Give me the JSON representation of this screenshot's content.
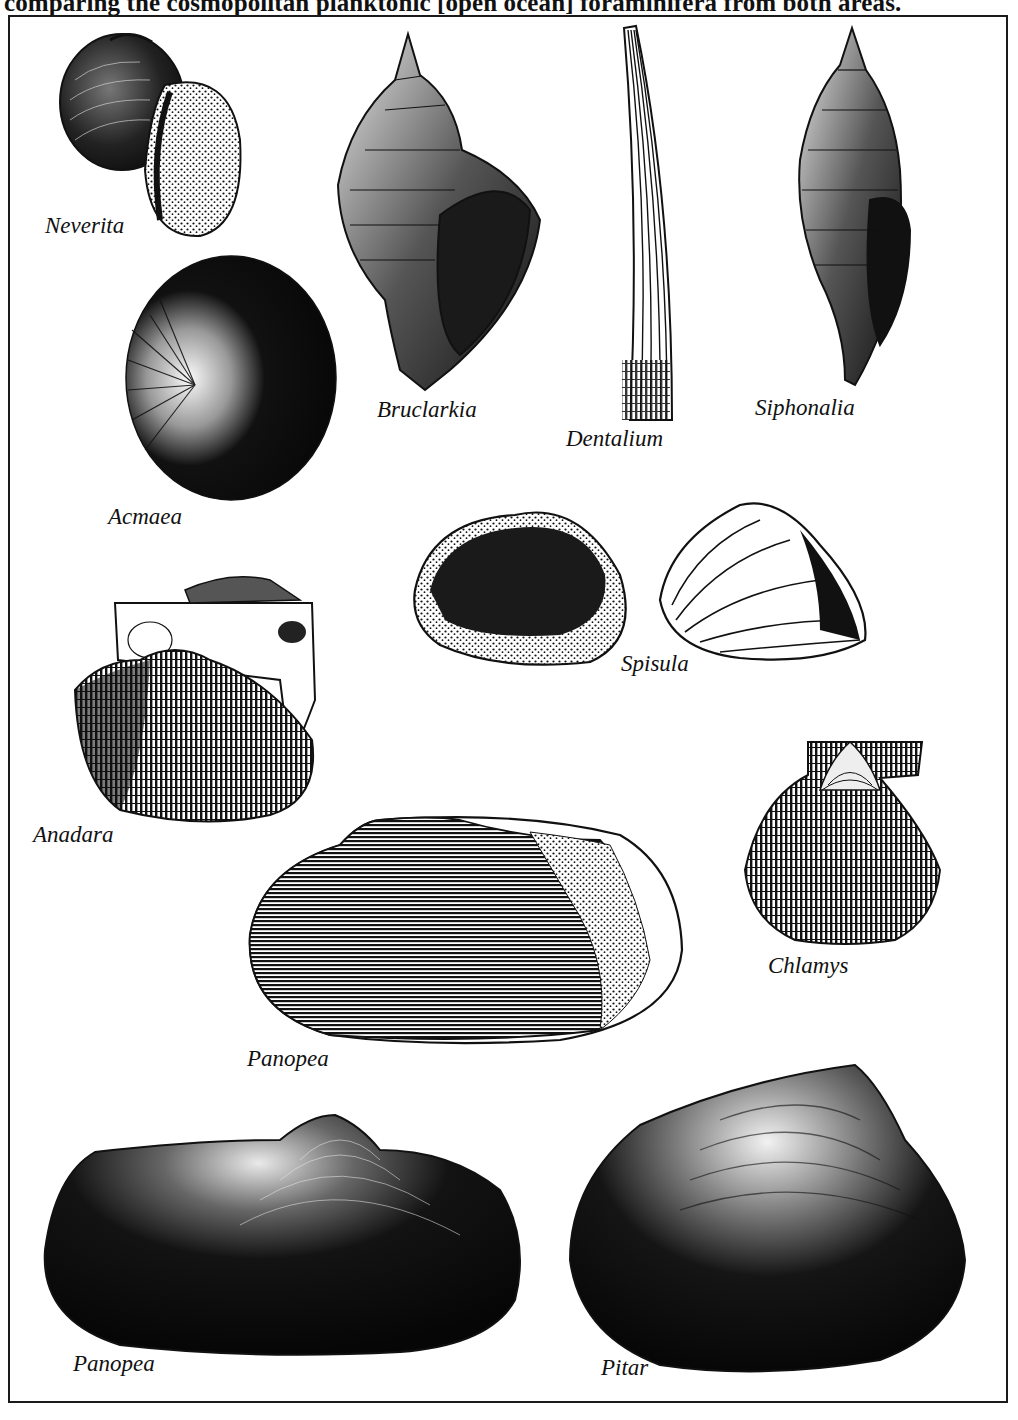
{
  "caption": "comparing the cosmopolitan planktonic [open ocean] foraminifera from both areas.",
  "figure": {
    "type": "shell-illustration-plate",
    "style": "black-and-white engraving",
    "colors": {
      "ink": "#111111",
      "paper": "#ffffff",
      "frame": "#1a1a1a"
    },
    "specimens": [
      {
        "id": "neverita",
        "label": "Neverita",
        "kind": "gastropod (moon snail)"
      },
      {
        "id": "bruclarkia",
        "label": "Bruclarkia",
        "kind": "gastropod (whelk)"
      },
      {
        "id": "dentalium",
        "label": "Dentalium",
        "kind": "scaphopod (tusk shell)"
      },
      {
        "id": "siphonalia",
        "label": "Siphonalia",
        "kind": "gastropod (spindle)"
      },
      {
        "id": "acmaea",
        "label": "Acmaea",
        "kind": "limpet"
      },
      {
        "id": "spisula",
        "label": "Spisula",
        "kind": "bivalve (two views)"
      },
      {
        "id": "anadara",
        "label": "Anadara",
        "kind": "bivalve (ark clam)"
      },
      {
        "id": "chlamys",
        "label": "Chlamys",
        "kind": "bivalve (scallop)"
      },
      {
        "id": "panopea_1",
        "label": "Panopea",
        "kind": "bivalve (geoduck)"
      },
      {
        "id": "panopea_2",
        "label": "Panopea",
        "kind": "bivalve (geoduck)"
      },
      {
        "id": "pitar",
        "label": "Pitar",
        "kind": "bivalve (venus clam)"
      }
    ]
  }
}
